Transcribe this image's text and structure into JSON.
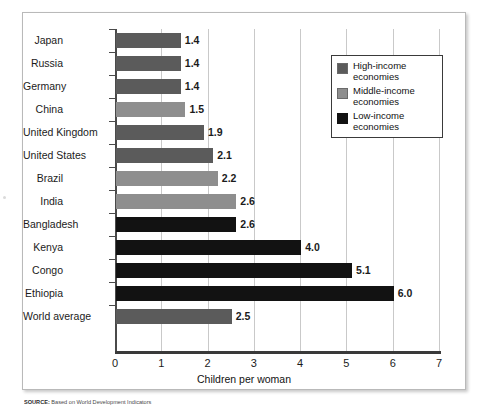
{
  "chart_data": {
    "type": "bar",
    "orientation": "horizontal",
    "title": "",
    "xlabel": "Children per woman",
    "ylabel": "",
    "xlim": [
      0,
      7
    ],
    "xticks": [
      "0",
      "1",
      "2",
      "3",
      "4",
      "5",
      "6",
      "7"
    ],
    "grid": "vertical",
    "legend_position": "top-right",
    "categories": [
      "Japan",
      "Russia",
      "Germany",
      "China",
      "United Kingdom",
      "United States",
      "Brazil",
      "India",
      "Bangladesh",
      "Kenya",
      "Congo",
      "Ethiopia",
      "World average"
    ],
    "values": [
      1.4,
      1.4,
      1.4,
      1.5,
      1.9,
      2.1,
      2.2,
      2.6,
      2.6,
      4.0,
      5.1,
      6.0,
      2.5
    ],
    "value_labels": [
      "1.4",
      "1.4",
      "1.4",
      "1.5",
      "1.9",
      "2.1",
      "2.2",
      "2.6",
      "2.6",
      "4.0",
      "5.1",
      "6.0",
      "2.5"
    ],
    "groups": [
      "high",
      "high",
      "high",
      "middle",
      "high",
      "high",
      "middle",
      "middle",
      "low",
      "low",
      "low",
      "low",
      "high"
    ],
    "bars": [
      {
        "label": "Japan",
        "value": 1.4,
        "value_label": "1.4",
        "group": "high"
      },
      {
        "label": "Russia",
        "value": 1.4,
        "value_label": "1.4",
        "group": "high"
      },
      {
        "label": "Germany",
        "value": 1.4,
        "value_label": "1.4",
        "group": "high"
      },
      {
        "label": "China",
        "value": 1.5,
        "value_label": "1.5",
        "group": "middle"
      },
      {
        "label": "United Kingdom",
        "value": 1.9,
        "value_label": "1.9",
        "group": "high"
      },
      {
        "label": "United States",
        "value": 2.1,
        "value_label": "2.1",
        "group": "high"
      },
      {
        "label": "Brazil",
        "value": 2.2,
        "value_label": "2.2",
        "group": "middle"
      },
      {
        "label": "India",
        "value": 2.6,
        "value_label": "2.6",
        "group": "middle"
      },
      {
        "label": "Bangladesh",
        "value": 2.6,
        "value_label": "2.6",
        "group": "low"
      },
      {
        "label": "Kenya",
        "value": 4.0,
        "value_label": "4.0",
        "group": "low"
      },
      {
        "label": "Congo",
        "value": 5.1,
        "value_label": "5.1",
        "group": "low"
      },
      {
        "label": "Ethiopia",
        "value": 6.0,
        "value_label": "6.0",
        "group": "low"
      },
      {
        "label": "World average",
        "value": 2.5,
        "value_label": "2.5",
        "group": "high"
      }
    ],
    "series": [
      {
        "name": "High-income economies",
        "key": "high",
        "color": "#5b5b5b"
      },
      {
        "name": "Middle-income economies",
        "key": "middle",
        "color": "#8e8e8e"
      },
      {
        "name": "Low-income economies",
        "key": "low",
        "color": "#121212"
      }
    ]
  },
  "legend": {
    "items": [
      {
        "line1": "High-income",
        "line2": "economies",
        "key": "high",
        "color": "#5b5b5b"
      },
      {
        "line1": "Middle-income",
        "line2": "economies",
        "key": "middle",
        "color": "#8e8e8e"
      },
      {
        "line1": "Low-income",
        "line2": "economies",
        "key": "low",
        "color": "#121212"
      }
    ]
  },
  "axis": {
    "x_title": "Children per woman",
    "ticks": [
      "0",
      "1",
      "2",
      "3",
      "4",
      "5",
      "6",
      "7"
    ]
  },
  "caption": {
    "source_label": "SOURCE:",
    "source_text": "Based on World Development Indicators"
  },
  "colors": {
    "high_income": "#5b5b5b",
    "middle_income": "#8e8e8e",
    "low_income": "#121212",
    "gridline": "#c9c9c9",
    "axis": "#3a3a3a",
    "frame": "#b9b9b9",
    "text": "#1b1b1b"
  }
}
